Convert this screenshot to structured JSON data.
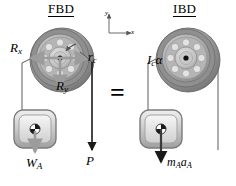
{
  "figure": {
    "kind": "free-body-diagram-vs-inertial-body-diagram",
    "equals_sign": "=",
    "panels": [
      {
        "id": "fbd",
        "title": "FBD",
        "labels": [
          {
            "name": "reaction-x-label",
            "base": "R",
            "sub": "x",
            "x": 10,
            "y": 42
          },
          {
            "name": "radius-c-label",
            "base": "r",
            "sub": "c",
            "x": 88,
            "y": 52
          },
          {
            "name": "reaction-y-label",
            "base": "R",
            "sub": "y",
            "x": 56,
            "y": 80
          },
          {
            "name": "weight-label",
            "base": "W",
            "sub": "A",
            "x": 28,
            "y": 158
          },
          {
            "name": "load-p-label",
            "base": "P",
            "sub": "",
            "x": 81,
            "y": 156
          }
        ]
      },
      {
        "id": "ibd",
        "title": "IBD",
        "labels": [
          {
            "name": "inertia-moment-label",
            "base": "I",
            "sub": "c",
            "suffix": "α",
            "x": 148,
            "y": 54
          },
          {
            "name": "inertia-force-label",
            "base": "m",
            "sub": "A",
            "base2": "a",
            "sub2": "A",
            "x": 185,
            "y": 158
          }
        ]
      }
    ],
    "axes": {
      "name": "coordinate-axes",
      "x_label": "x",
      "y_label": "y",
      "origin_x": 109,
      "origin_y": 33
    },
    "colors": {
      "pulley_outer": "#8d8d8d",
      "pulley_mid": "#a8a8a8",
      "pulley_inner": "#c8c8c8",
      "pulley_dark": "#6e6e6e",
      "block_fill": "#d9d9d9",
      "block_edge": "#8a8a8a",
      "arrow_gray": "#9c9c9c",
      "arrow_black": "#1a1a1a",
      "line": "#5a5a5a"
    }
  }
}
